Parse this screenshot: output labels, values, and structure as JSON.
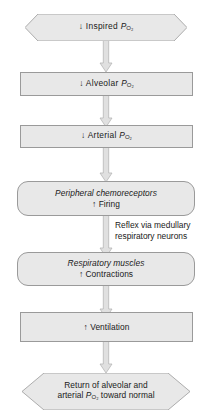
{
  "diagram": {
    "colors": {
      "node_fill": "#e8e8e8",
      "node_border": "#9a9a9a",
      "arrow_fill": "#e0e0e0",
      "arrow_border": "#b0b0b0",
      "text": "#1a1a1a",
      "background": "#ffffff"
    },
    "nodes": [
      {
        "id": "inspired-po2",
        "shape": "hexagon",
        "lines": [
          {
            "prefix": "↓ Inspired ",
            "variable": "P",
            "subscript": "O₂",
            "suffix": "",
            "italic": false
          }
        ]
      },
      {
        "id": "alveolar-po2",
        "shape": "rectangle",
        "lines": [
          {
            "prefix": "↓ Alveolar ",
            "variable": "P",
            "subscript": "O₂",
            "suffix": "",
            "italic": false
          }
        ]
      },
      {
        "id": "arterial-po2",
        "shape": "rectangle",
        "lines": [
          {
            "prefix": "↓ Arterial ",
            "variable": "P",
            "subscript": "O₂",
            "suffix": "",
            "italic": false
          }
        ]
      },
      {
        "id": "peripheral-chemoreceptors",
        "shape": "rounded-rectangle",
        "lines": [
          {
            "prefix": "Peripheral chemoreceptors",
            "variable": "",
            "subscript": "",
            "suffix": "",
            "italic": true
          },
          {
            "prefix": "↑ Firing",
            "variable": "",
            "subscript": "",
            "suffix": "",
            "italic": false
          }
        ]
      },
      {
        "id": "respiratory-muscles",
        "shape": "rounded-rectangle",
        "lines": [
          {
            "prefix": "Respiratory muscles",
            "variable": "",
            "subscript": "",
            "suffix": "",
            "italic": true
          },
          {
            "prefix": "↑ Contractions",
            "variable": "",
            "subscript": "",
            "suffix": "",
            "italic": false
          }
        ]
      },
      {
        "id": "ventilation",
        "shape": "rectangle",
        "lines": [
          {
            "prefix": "↑ Ventilation",
            "variable": "",
            "subscript": "",
            "suffix": "",
            "italic": false
          }
        ]
      },
      {
        "id": "return-to-normal",
        "shape": "hexagon",
        "lines": [
          {
            "prefix": "Return of alveolar and",
            "variable": "",
            "subscript": "",
            "suffix": "",
            "italic": false
          },
          {
            "prefix": "arterial ",
            "variable": "P",
            "subscript": "O₂",
            "suffix": " toward normal",
            "italic": false
          }
        ]
      }
    ],
    "annotations": [
      {
        "id": "reflex-pathway",
        "line1": "Reflex via medullary",
        "line2": "respiratory neurons"
      }
    ],
    "labels": {
      "inspired_po2_l1_prefix": "↓ Inspired ",
      "alveolar_po2_l1_prefix": "↓ Alveolar ",
      "arterial_po2_l1_prefix": "↓ Arterial ",
      "p_variable": "P",
      "o2_subscript": "O₂",
      "chemo_l1": "Peripheral chemoreceptors",
      "chemo_l2": "↑ Firing",
      "muscles_l1": "Respiratory muscles",
      "muscles_l2": "↑ Contractions",
      "ventilation_l1": "↑ Ventilation",
      "return_l1": "Return of alveolar and",
      "return_l2_prefix": "arterial ",
      "return_l2_suffix": " toward normal",
      "annot_l1": "Reflex via medullary",
      "annot_l2": "respiratory neurons"
    }
  }
}
